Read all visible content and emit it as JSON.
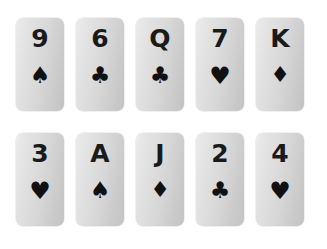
{
  "background_color": "#ffffff",
  "card_face_color_light": "#ececec",
  "card_face_color_dark": "#c2c2c2",
  "pip_color": "#111111",
  "rank_color": "#1a1a1a",
  "layout": {
    "columns": 5,
    "rows": 2,
    "card_width_px": 48,
    "card_height_px": 93,
    "corner_radius_px": 7
  },
  "suit_glyphs": {
    "spade": "♠",
    "club": "♣",
    "heart": "♥",
    "diamond": "♦"
  },
  "rows": [
    {
      "cards": [
        {
          "rank": "9",
          "suit": "spade",
          "suit_glyph": "♠"
        },
        {
          "rank": "6",
          "suit": "club",
          "suit_glyph": "♣"
        },
        {
          "rank": "Q",
          "suit": "club",
          "suit_glyph": "♣"
        },
        {
          "rank": "7",
          "suit": "heart",
          "suit_glyph": "♥"
        },
        {
          "rank": "K",
          "suit": "diamond",
          "suit_glyph": "♦"
        }
      ]
    },
    {
      "cards": [
        {
          "rank": "3",
          "suit": "heart",
          "suit_glyph": "♥"
        },
        {
          "rank": "A",
          "suit": "spade",
          "suit_glyph": "♠"
        },
        {
          "rank": "J",
          "suit": "diamond",
          "suit_glyph": "♦"
        },
        {
          "rank": "2",
          "suit": "club",
          "suit_glyph": "♣"
        },
        {
          "rank": "4",
          "suit": "heart",
          "suit_glyph": "♥"
        }
      ]
    }
  ]
}
